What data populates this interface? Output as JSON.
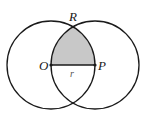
{
  "diagram": {
    "type": "geometry",
    "labels": {
      "top_intersection": "R",
      "left_center": "O",
      "right_center": "P",
      "radius": "r"
    },
    "colors": {
      "stroke": "#1a1a1a",
      "shade": "#c8c8c8",
      "background": "#ffffff"
    },
    "geometry": {
      "left_circle": {
        "cx": 51,
        "cy": 65,
        "r": 44
      },
      "right_circle": {
        "cx": 95,
        "cy": 65,
        "r": 44
      },
      "R_point": {
        "x": 73,
        "y": 26.9
      },
      "O_point": {
        "x": 51,
        "y": 65
      },
      "P_point": {
        "x": 95,
        "y": 65
      }
    }
  }
}
